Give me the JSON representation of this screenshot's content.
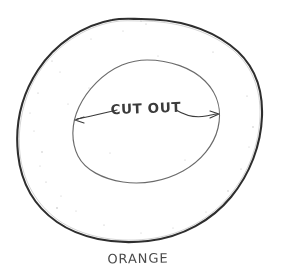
{
  "drawing": {
    "title": "Orange cut out sketch",
    "style": "hand-drawn pencil sketch on white paper",
    "background_color": "#ffffff",
    "ink_color": "#3a3a3a",
    "outer_line_color": "#2e2e2e",
    "inner_line_color": "#6b6b6b",
    "speckle_color": "#b9b9b9"
  },
  "labels": {
    "cut_out": "CUT OUT",
    "orange": "ORANGE"
  },
  "shapes": {
    "outer_circle": {
      "name": "orange-peel-outline",
      "center_x": 140,
      "center_y": 130,
      "radius_x": 122,
      "radius_y": 111,
      "stroke_width": 2.1
    },
    "inner_circle": {
      "name": "cut-out-region",
      "center_x": 146,
      "center_y": 123,
      "radius_x": 74,
      "radius_y": 63,
      "stroke_width": 1.1
    },
    "arrow": {
      "name": "cut-out-width-arrow",
      "left_tip_x": 75,
      "left_tip_y": 120,
      "right_tip_x": 218,
      "right_tip_y": 114,
      "double_headed": true
    }
  },
  "text_positions": {
    "cut_out": {
      "x": 146,
      "y": 113,
      "font_size": 13,
      "rotation": -2
    },
    "orange": {
      "x": 138,
      "y": 262,
      "font_size": 13,
      "rotation": -1
    }
  }
}
